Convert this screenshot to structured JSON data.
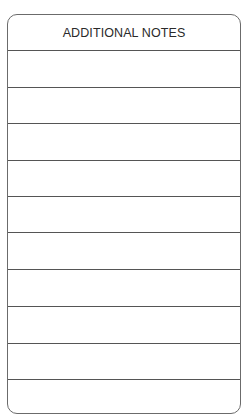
{
  "card": {
    "title": "ADDITIONAL NOTES",
    "line_count": 10,
    "line_positions_px": [
      35,
      72,
      108,
      145,
      181,
      217,
      254,
      291,
      328,
      364
    ],
    "border_color": "#6b6b6b",
    "line_color": "#555555"
  }
}
